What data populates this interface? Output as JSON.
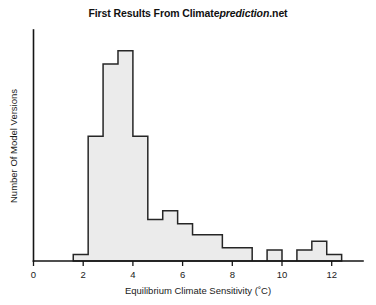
{
  "chart_data": {
    "type": "bar",
    "title": "First Results From Climateprediction.net",
    "title_plain": "First Results From Climate",
    "title_italic": "prediction",
    "title_suffix": ".net",
    "xlabel": "Equilibrium Climate Sensitivity (˚C)",
    "ylabel": "Number Of Model Versions",
    "xlim": [
      -0.4,
      13.2
    ],
    "ylim": [
      0,
      100
    ],
    "xticks": [
      0,
      2,
      4,
      6,
      8,
      10,
      12
    ],
    "xtick_labels": [
      "0",
      "2",
      "4",
      "6",
      "8",
      "10",
      "12"
    ],
    "yticks": [],
    "ytick_labels": [],
    "grid": false,
    "legend": null,
    "bin_width": 0.6,
    "bin_edges": [
      1.6,
      2.2,
      2.8,
      3.4,
      4.0,
      4.6,
      5.2,
      5.8,
      6.4,
      7.0,
      7.6,
      8.2,
      8.8,
      9.4,
      10.0,
      10.6,
      11.2,
      11.8,
      12.4
    ],
    "categories": [
      "1.6-2.2",
      "2.2-2.8",
      "2.8-3.4",
      "3.4-4.0",
      "4.0-4.6",
      "4.6-5.2",
      "5.2-5.8",
      "5.8-6.4",
      "6.4-7.0",
      "7.0-7.6",
      "7.6-8.2",
      "8.2-8.8",
      "8.8-9.4",
      "9.4-10.0",
      "10.0-10.6",
      "10.6-11.2",
      "11.2-11.8",
      "11.8-12.4"
    ],
    "values": [
      3,
      57,
      90,
      96,
      57,
      19,
      23,
      17,
      12,
      12,
      6,
      6,
      0,
      5,
      0,
      5,
      9,
      3
    ],
    "colors": {
      "bar_fill": "#ebebeb",
      "bar_edge": "#262626",
      "axis": "#151515",
      "text": "#1a1a1a",
      "background": "#ffffff"
    }
  },
  "figure": {
    "background": "#ffffff"
  }
}
